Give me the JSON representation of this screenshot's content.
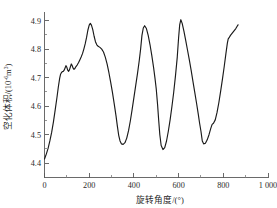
{
  "chart_data": {
    "type": "line",
    "title": "",
    "subtitle": "",
    "xlabel": "旋转角度/(°)",
    "ylabel_main": "空化体积/(10",
    "ylabel_exp": "-6",
    "ylabel_tail": "m",
    "ylabel_tail_exp": "3",
    "ylabel_close": ")",
    "ylabel_full": "空化体积/(10⁻⁶m³)",
    "xlim": [
      0,
      1000
    ],
    "ylim": [
      4.35,
      4.93
    ],
    "grid": false,
    "legend": false,
    "legend_position": "none",
    "line_color": "#1a1a1a",
    "axis_color": "#5a5a5a",
    "xticks": [
      0,
      200,
      400,
      600,
      800,
      1000
    ],
    "xticklabels": [
      "0",
      "200",
      "400",
      "600",
      "800",
      "1 000"
    ],
    "xtick_minor_step": 100,
    "yticks": [
      4.4,
      4.5,
      4.6,
      4.7,
      4.8,
      4.9
    ],
    "yticklabels": [
      "4.4",
      "4.5",
      "4.6",
      "4.7",
      "4.8",
      "4.9"
    ],
    "ytick_minor_step": 0.05,
    "series": [
      {
        "name": "空化体积",
        "x": [
          0,
          8,
          16,
          24,
          32,
          40,
          48,
          56,
          62,
          68,
          72,
          76,
          80,
          84,
          88,
          92,
          96,
          100,
          104,
          108,
          112,
          116,
          120,
          124,
          128,
          132,
          136,
          140,
          146,
          152,
          158,
          164,
          170,
          176,
          182,
          188,
          194,
          200,
          205,
          210,
          216,
          222,
          228,
          234,
          240,
          248,
          256,
          264,
          272,
          280,
          288,
          296,
          304,
          312,
          320,
          326,
          332,
          338,
          344,
          352,
          360,
          368,
          376,
          384,
          392,
          400,
          408,
          416,
          424,
          430,
          436,
          442,
          448,
          456,
          464,
          472,
          480,
          488,
          494,
          500,
          506,
          511,
          516,
          522,
          530,
          538,
          546,
          554,
          562,
          570,
          578,
          586,
          594,
          600,
          605,
          610,
          616,
          624,
          632,
          640,
          648,
          656,
          664,
          672,
          680,
          688,
          694,
          700,
          706,
          712,
          720,
          728,
          736,
          744,
          750,
          756,
          764,
          772,
          780,
          788,
          796,
          804,
          812,
          818,
          822,
          826,
          832,
          840,
          848,
          856,
          862,
          866
        ],
        "values": [
          4.415,
          4.432,
          4.452,
          4.478,
          4.508,
          4.545,
          4.588,
          4.632,
          4.668,
          4.698,
          4.712,
          4.718,
          4.721,
          4.722,
          4.726,
          4.734,
          4.742,
          4.736,
          4.726,
          4.722,
          4.728,
          4.738,
          4.748,
          4.742,
          4.733,
          4.729,
          4.732,
          4.738,
          4.744,
          4.752,
          4.762,
          4.772,
          4.784,
          4.8,
          4.818,
          4.84,
          4.866,
          4.884,
          4.89,
          4.884,
          4.868,
          4.845,
          4.826,
          4.815,
          4.81,
          4.806,
          4.8,
          4.79,
          4.772,
          4.748,
          4.718,
          4.684,
          4.648,
          4.608,
          4.566,
          4.53,
          4.498,
          4.478,
          4.468,
          4.466,
          4.472,
          4.488,
          4.514,
          4.548,
          4.588,
          4.63,
          4.672,
          4.714,
          4.76,
          4.8,
          4.848,
          4.874,
          4.882,
          4.872,
          4.848,
          4.816,
          4.778,
          4.736,
          4.7,
          4.66,
          4.605,
          4.55,
          4.5,
          4.462,
          4.448,
          4.455,
          4.478,
          4.512,
          4.552,
          4.598,
          4.648,
          4.706,
          4.772,
          4.84,
          4.886,
          4.903,
          4.89,
          4.862,
          4.83,
          4.796,
          4.762,
          4.726,
          4.688,
          4.65,
          4.612,
          4.572,
          4.54,
          4.512,
          4.478,
          4.468,
          4.47,
          4.482,
          4.5,
          4.522,
          4.536,
          4.54,
          4.552,
          4.578,
          4.612,
          4.652,
          4.694,
          4.738,
          4.786,
          4.82,
          4.836,
          4.84,
          4.848,
          4.856,
          4.864,
          4.872,
          4.88,
          4.885
        ],
        "peaks": [
          {
            "x": 205,
            "y": 4.89
          },
          {
            "x": 448,
            "y": 4.882
          },
          {
            "x": 605,
            "y": 4.903
          },
          {
            "x": 866,
            "y": 4.885
          }
        ],
        "valleys": [
          {
            "x": 0,
            "y": 4.415
          },
          {
            "x": 352,
            "y": 4.466
          },
          {
            "x": 562,
            "y": 4.448
          },
          {
            "x": 706,
            "y": 4.468
          }
        ]
      }
    ]
  }
}
